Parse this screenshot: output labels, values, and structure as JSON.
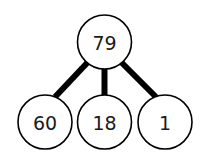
{
  "tree": {
    "root": {
      "label": "79"
    },
    "children": [
      {
        "label": "60"
      },
      {
        "label": "18"
      },
      {
        "label": "1"
      }
    ]
  },
  "colors": {
    "stroke": "#000000",
    "fill": "#ffffff",
    "text": "#1a1a1a"
  }
}
